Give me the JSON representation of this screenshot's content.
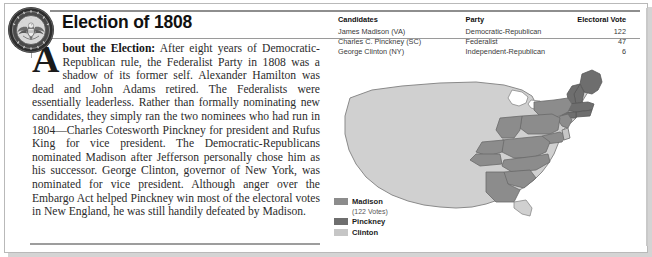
{
  "page": {
    "title": "Election of 1808",
    "seal_icon": "presidential-seal-icon"
  },
  "article": {
    "dropcap": "A",
    "lead_in": "bout the Election:",
    "body": " After eight years of Democratic-Republican rule, the Federalist Party in 1808 was a shadow of its former self. Alexander Hamilton was dead and John Adams retired. The Federalists were essentially leaderless. Rather than formally nominating new candidates, they simply ran the two nominees who had run in 1804—Charles Cotesworth Pinckney for president and Rufus King for vice president. The Democratic-Republicans nominated Madison after Jefferson personally chose him as his successor. George Clinton, governor of New York, was nominated for vice president. Although anger over the Embargo Act helped Pinckney win most of the electoral votes in New England, he was still handily defeated by Madison."
  },
  "results_table": {
    "columns": [
      "Candidates",
      "Party",
      "Electoral Vote"
    ],
    "rows": [
      {
        "candidate": "James Madison (VA)",
        "party": "Democratic-Republican",
        "electoral_vote": "122"
      },
      {
        "candidate": "Charles C. Pinckney (SC)",
        "party": "Federalist",
        "electoral_vote": "47"
      },
      {
        "candidate": "George Clinton (NY)",
        "party": "Independent-Republican",
        "electoral_vote": "6"
      }
    ]
  },
  "legend": {
    "items": [
      {
        "label": "Madison",
        "sub": "(122 Votes)",
        "color": "#8c8c8c"
      },
      {
        "label": "Pinckney",
        "sub": "",
        "color": "#6e6e6e"
      },
      {
        "label": "Clinton",
        "sub": "",
        "color": "#c6c6c6"
      }
    ]
  },
  "map": {
    "name": "united-states-electoral-map-1808",
    "base_color": "#d0d0d0",
    "outline_color": "#8a8a8a",
    "madison_color": "#8c8c8c",
    "pinckney_color": "#6e6e6e",
    "clinton_color": "#c6c6c6"
  }
}
